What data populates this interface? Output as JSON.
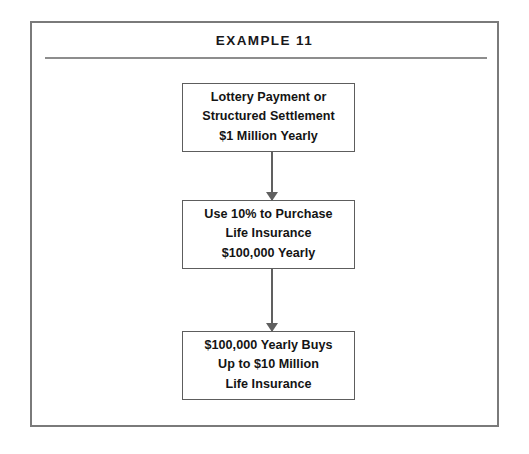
{
  "figure": {
    "title": "EXAMPLE 11",
    "type": "flowchart",
    "border_color": "#7a7a7a",
    "text_color": "#1a1a1a",
    "background_color": "#ffffff"
  },
  "flow": {
    "nodes": [
      {
        "id": "node-1",
        "lines": [
          "Lottery Payment or",
          "Structured Settlement",
          "$1 Million Yearly"
        ]
      },
      {
        "id": "node-2",
        "lines": [
          "Use 10% to Purchase",
          "Life Insurance",
          "$100,000 Yearly"
        ]
      },
      {
        "id": "node-3",
        "lines": [
          "$100,000 Yearly Buys",
          "Up to $10 Million",
          "Life Insurance"
        ]
      }
    ],
    "connectors": [
      {
        "id": "connector-1",
        "from": "node-1",
        "to": "node-2",
        "direction": "down"
      },
      {
        "id": "connector-2",
        "from": "node-2",
        "to": "node-3",
        "direction": "down"
      }
    ]
  }
}
